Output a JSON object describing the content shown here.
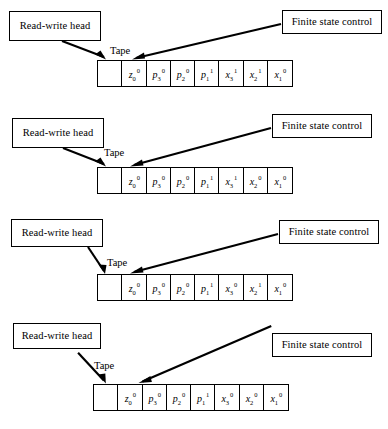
{
  "figure": {
    "labels": {
      "read_write_head": "Read-write head",
      "finite_state_control": "Finite state control",
      "tape": "Tape"
    },
    "colors": {
      "ink": "#000000",
      "background": "#ffffff"
    },
    "panels": [
      {
        "id": "panel-1",
        "read_write_head_label": "Read-write head",
        "finite_state_control_label": "Finite state control",
        "tape_label": "Tape",
        "cells": [
          {
            "base": "",
            "sub": "",
            "sup": ""
          },
          {
            "base": "z",
            "sub": "0",
            "sup": "0"
          },
          {
            "base": "p",
            "sub": "3",
            "sup": "0"
          },
          {
            "base": "p",
            "sub": "2",
            "sup": "0"
          },
          {
            "base": "p",
            "sub": "1",
            "sup": "1"
          },
          {
            "base": "x",
            "sub": "3",
            "sup": "1"
          },
          {
            "base": "x",
            "sub": "2",
            "sup": "1"
          },
          {
            "base": "x",
            "sub": "1",
            "sup": "0"
          }
        ]
      },
      {
        "id": "panel-2",
        "read_write_head_label": "Read-write head",
        "finite_state_control_label": "Finite state control",
        "tape_label": "Tape",
        "cells": [
          {
            "base": "",
            "sub": "",
            "sup": ""
          },
          {
            "base": "z",
            "sub": "0",
            "sup": "0"
          },
          {
            "base": "p",
            "sub": "3",
            "sup": "0"
          },
          {
            "base": "p",
            "sub": "2",
            "sup": "0"
          },
          {
            "base": "p",
            "sub": "1",
            "sup": "1"
          },
          {
            "base": "x",
            "sub": "3",
            "sup": "1"
          },
          {
            "base": "x",
            "sub": "2",
            "sup": "0"
          },
          {
            "base": "x",
            "sub": "1",
            "sup": "0"
          }
        ]
      },
      {
        "id": "panel-3",
        "read_write_head_label": "Read-write head",
        "finite_state_control_label": "Finite state control",
        "tape_label": "Tape",
        "cells": [
          {
            "base": "",
            "sub": "",
            "sup": ""
          },
          {
            "base": "z",
            "sub": "0",
            "sup": "0"
          },
          {
            "base": "p",
            "sub": "3",
            "sup": "0"
          },
          {
            "base": "p",
            "sub": "2",
            "sup": "0"
          },
          {
            "base": "p",
            "sub": "1",
            "sup": "1"
          },
          {
            "base": "x",
            "sub": "3",
            "sup": "0"
          },
          {
            "base": "x",
            "sub": "2",
            "sup": "1"
          },
          {
            "base": "x",
            "sub": "1",
            "sup": "0"
          }
        ]
      },
      {
        "id": "panel-4",
        "read_write_head_label": "Read-write head",
        "finite_state_control_label": "Finite state control",
        "tape_label": "Tape",
        "cells": [
          {
            "base": "",
            "sub": "",
            "sup": ""
          },
          {
            "base": "z",
            "sub": "0",
            "sup": "0"
          },
          {
            "base": "p",
            "sub": "3",
            "sup": "0"
          },
          {
            "base": "p",
            "sub": "2",
            "sup": "0"
          },
          {
            "base": "p",
            "sub": "1",
            "sup": "1"
          },
          {
            "base": "x",
            "sub": "3",
            "sup": "0"
          },
          {
            "base": "x",
            "sub": "2",
            "sup": "0"
          },
          {
            "base": "x",
            "sub": "1",
            "sup": "0"
          }
        ]
      }
    ]
  }
}
